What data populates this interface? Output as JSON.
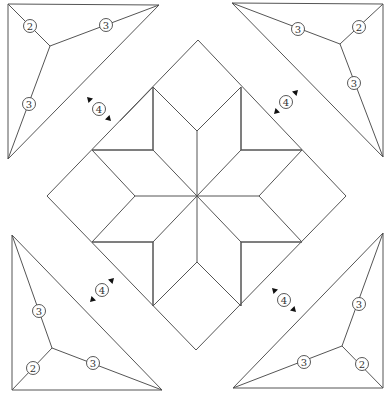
{
  "diagram": {
    "title": "",
    "colors": {
      "line": "#555555",
      "background": "#ffffff",
      "arrow": "#111111"
    },
    "corner_triangles": [
      {
        "name": "top-left",
        "points": [
          [
            8,
            4
          ],
          [
            159,
            5
          ],
          [
            8,
            159
          ]
        ],
        "node": [
          50,
          46
        ],
        "labels": [
          {
            "text": "2",
            "x": 30,
            "y": 26
          },
          {
            "text": "3",
            "x": 106,
            "y": 25
          },
          {
            "text": "3",
            "x": 29,
            "y": 104
          }
        ]
      },
      {
        "name": "top-right",
        "points": [
          [
            232,
            3
          ],
          [
            383,
            4
          ],
          [
            383,
            157
          ]
        ],
        "node": [
          340,
          44
        ],
        "labels": [
          {
            "text": "3",
            "x": 298,
            "y": 29
          },
          {
            "text": "2",
            "x": 359,
            "y": 27
          },
          {
            "text": "3",
            "x": 354,
            "y": 83
          }
        ]
      },
      {
        "name": "bottom-left",
        "points": [
          [
            12,
            235
          ],
          [
            12,
            390
          ],
          [
            162,
            390
          ]
        ],
        "node": [
          52,
          348
        ],
        "labels": [
          {
            "text": "3",
            "x": 39,
            "y": 311
          },
          {
            "text": "2",
            "x": 33,
            "y": 368
          },
          {
            "text": "3",
            "x": 93,
            "y": 363
          }
        ]
      },
      {
        "name": "bottom-right",
        "points": [
          [
            383,
            233
          ],
          [
            383,
            388
          ],
          [
            233,
            388
          ]
        ],
        "node": [
          342,
          346
        ],
        "labels": [
          {
            "text": "3",
            "x": 359,
            "y": 304
          },
          {
            "text": "2",
            "x": 362,
            "y": 364
          },
          {
            "text": "3",
            "x": 304,
            "y": 362
          }
        ]
      }
    ],
    "rotate_markers": [
      {
        "text": "4",
        "x": 99,
        "y": 109,
        "dir": "nw-se"
      },
      {
        "text": "4",
        "x": 286,
        "y": 102,
        "dir": "ne-sw"
      },
      {
        "text": "4",
        "x": 102,
        "y": 290,
        "dir": "ne-sw"
      },
      {
        "text": "4",
        "x": 284,
        "y": 300,
        "dir": "nw-se"
      }
    ],
    "outer_square": [
      [
        198,
        40
      ],
      [
        346,
        196
      ],
      [
        196,
        350
      ],
      [
        47,
        196
      ]
    ],
    "star": {
      "center": [
        197,
        196
      ],
      "tips": [
        [
          153,
          87
        ],
        [
          241,
          87
        ],
        [
          302,
          150
        ],
        [
          302,
          242
        ],
        [
          241,
          306
        ],
        [
          153,
          306
        ],
        [
          92,
          242
        ],
        [
          92,
          150
        ]
      ],
      "notches": [
        [
          197,
          131
        ],
        [
          259,
          196
        ],
        [
          197,
          262
        ],
        [
          135,
          196
        ]
      ],
      "inner": [
        [
          153,
          150
        ],
        [
          241,
          150
        ],
        [
          241,
          242
        ],
        [
          153,
          242
        ]
      ]
    }
  }
}
